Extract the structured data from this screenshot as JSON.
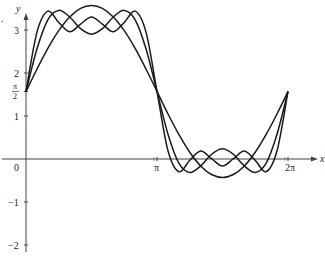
{
  "figure": {
    "marker": "."
  },
  "chart_data": {
    "type": "line",
    "title": "",
    "xlabel": "x",
    "ylabel": "y",
    "xlim": [
      0,
      6.2832
    ],
    "ylim": [
      -2.4,
      3.6
    ],
    "grid": false,
    "legend": null,
    "x_ticks": [
      {
        "value": 0,
        "label": "0"
      },
      {
        "value": 3.1416,
        "label": "π"
      },
      {
        "value": 6.2832,
        "label": "2π"
      }
    ],
    "y_ticks": [
      {
        "value": -2,
        "label": "−2"
      },
      {
        "value": -1,
        "label": "−1"
      },
      {
        "value": 1,
        "label": "1"
      },
      {
        "value": 1.5708,
        "label": "π/2"
      },
      {
        "value": 2,
        "label": "2"
      },
      {
        "value": 3,
        "label": "3"
      }
    ],
    "x": [
      0,
      0.2618,
      0.5236,
      0.7854,
      1.0472,
      1.309,
      1.5708,
      1.8326,
      2.0944,
      2.3562,
      2.618,
      2.8798,
      3.1416,
      3.4034,
      3.6652,
      3.927,
      4.1888,
      4.4506,
      4.7124,
      4.9742,
      5.236,
      5.4978,
      5.7596,
      6.0214,
      6.2832
    ],
    "series": [
      {
        "name": "S1",
        "values": [
          1.571,
          2.088,
          2.571,
          2.985,
          3.303,
          3.503,
          3.571,
          3.503,
          3.303,
          2.985,
          2.571,
          2.088,
          1.571,
          1.053,
          0.571,
          0.157,
          -0.161,
          -0.361,
          -0.429,
          -0.361,
          -0.161,
          0.157,
          0.571,
          1.053,
          1.571
        ]
      },
      {
        "name": "S2",
        "values": [
          1.571,
          2.559,
          3.238,
          3.456,
          3.303,
          3.032,
          2.904,
          3.032,
          3.303,
          3.456,
          3.238,
          2.559,
          1.571,
          0.582,
          -0.096,
          -0.314,
          -0.161,
          0.11,
          0.238,
          0.11,
          -0.161,
          -0.314,
          -0.096,
          0.582,
          1.571
        ]
      },
      {
        "name": "S3",
        "values": [
          1.571,
          2.945,
          3.438,
          3.173,
          2.957,
          3.136,
          3.304,
          3.136,
          2.957,
          3.173,
          3.438,
          2.945,
          1.571,
          0.196,
          -0.296,
          -0.031,
          0.185,
          0.006,
          -0.162,
          0.006,
          0.185,
          -0.031,
          -0.296,
          0.196,
          1.571
        ]
      }
    ]
  }
}
